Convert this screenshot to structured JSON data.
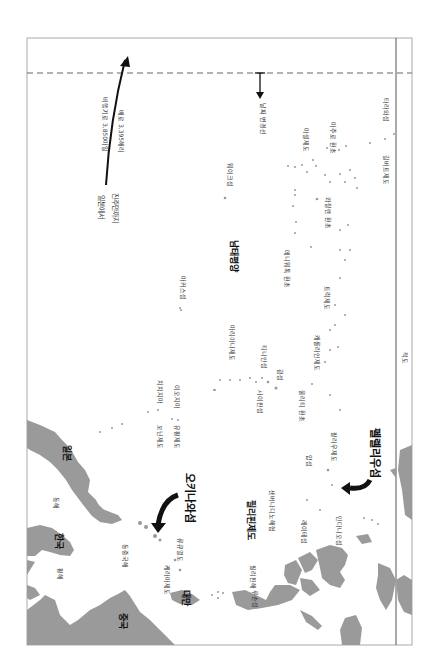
{
  "map": {
    "title": "Pacific Theater map (rotated)",
    "colors": {
      "land": "#9a9a9a",
      "frame": "#aaaaaa",
      "equator": "#555555",
      "arrow": "#111111"
    },
    "lines": {
      "equator_label": "적도",
      "date_line_label": "날짜 변경선"
    },
    "route": {
      "label_line1": "일본에서",
      "label_line2": "진주만까지",
      "distance_air": "비행기로 3,850마일",
      "distance_sea": "배로 3,395해리"
    },
    "callouts": {
      "okinawa": "오키나와섬",
      "peleliu": "펠렐리우섬"
    },
    "countries": {
      "china": "중국",
      "korea": "한국",
      "japan": "일본",
      "taiwan": "대만"
    },
    "seas": {
      "yellow_sea": "황해",
      "east_sea": "동해",
      "east_china_sea": "동중국해",
      "philippine_sea": "필리핀해",
      "south_pacific": "남태평양"
    },
    "places": {
      "ryukyu": "류큐열도",
      "kerama": "케라마제도",
      "bonin": "보닌제도",
      "volcano": "유황제도",
      "chichijima": "치치지마",
      "iwojima": "이오지마",
      "marcus": "마커스섬",
      "wake": "웨이크섬",
      "mariana": "마리아나제도",
      "saipan": "사이판섬",
      "tinian": "티니안섬",
      "guam": "괌섬",
      "ulithi": "울리티 환초",
      "yap": "얍섬",
      "palau": "팔라우제도",
      "caroline": "캐롤라인제도",
      "truk": "트럭제도",
      "eniwetok": "에니웨톡 환초",
      "kwajalein": "콰잘렌 환초",
      "marshall": "마셜제도",
      "majuro": "마주로 환초",
      "gilbert": "길버트제도",
      "tarawa": "타라와섬",
      "philippines": "필리핀제도",
      "luzon": "루손섬",
      "san_bernardino": "샌버나디노해협",
      "leyte": "레이테섬",
      "mindanao": "민다나오섬"
    }
  }
}
